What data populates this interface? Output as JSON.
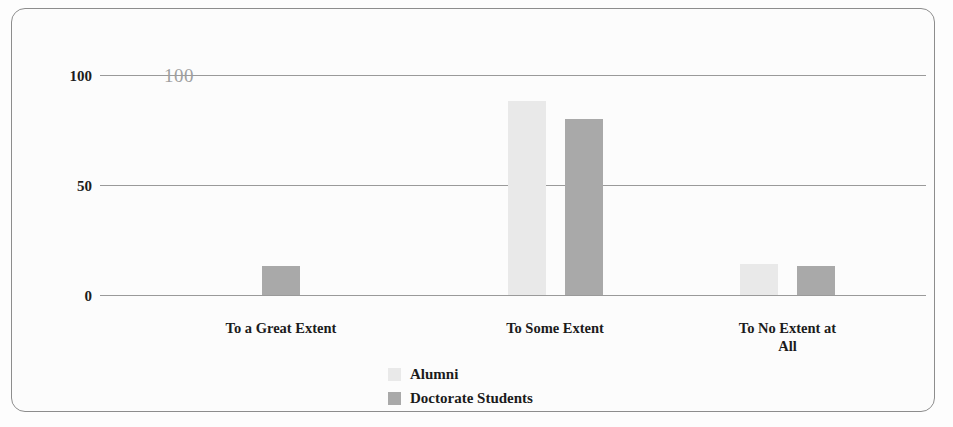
{
  "chart_data": {
    "type": "bar",
    "title": "",
    "subtitle": "",
    "xlabel": "",
    "ylabel": "",
    "categories": [
      "To a Great Extent",
      "To Some Extent",
      "To No Extent at All"
    ],
    "series": [
      {
        "name": "Alumni",
        "color": "#e9e9e9",
        "values": [
          0,
          88,
          14
        ]
      },
      {
        "name": "Doctorate Students",
        "color": "#a9a9a9",
        "values": [
          13,
          80,
          13
        ]
      }
    ],
    "ylim": [
      0,
      100
    ],
    "yticks": [
      "0",
      "50",
      "100"
    ],
    "grid": true,
    "legend_position": "bottom-center",
    "annotations": [
      "100"
    ]
  },
  "axis": {
    "y_tick_100": "100",
    "y_tick_50": "50",
    "y_tick_0": "0"
  },
  "annotation": {
    "top_value": "100"
  },
  "categories": {
    "c0": "To a Great Extent",
    "c1": "To Some Extent",
    "c2_line1": "To No Extent at",
    "c2_line2": "All"
  },
  "legend": {
    "items": [
      {
        "label": "Alumni",
        "color": "#e9e9e9"
      },
      {
        "label": "Doctorate Students",
        "color": "#a9a9a9"
      }
    ],
    "alumni_label": "Alumni",
    "doctorate_label": "Doctorate Students"
  },
  "colors": {
    "alumni": "#e9e9e9",
    "doctorate": "#a9a9a9",
    "gridline": "#9a9a9a",
    "frame": "#8d8d8d",
    "text": "#1b1b1b",
    "annotation": "#9f9f9f"
  }
}
